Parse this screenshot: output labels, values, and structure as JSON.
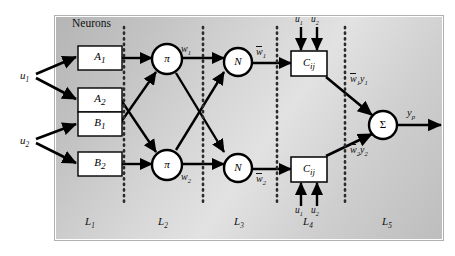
{
  "figure": {
    "title_label": "Neurons",
    "background": "#d0d0d0",
    "frame_color": "#ffffff"
  },
  "inputs": [
    {
      "name": "u1",
      "label": "u",
      "sub": "1"
    },
    {
      "name": "u2",
      "label": "u",
      "sub": "2"
    }
  ],
  "layer1_nodes": [
    {
      "name": "A1",
      "label": "A",
      "sub": "1"
    },
    {
      "name": "A2",
      "label": "A",
      "sub": "2"
    },
    {
      "name": "B1",
      "label": "B",
      "sub": "1"
    },
    {
      "name": "B2",
      "label": "B",
      "sub": "2"
    }
  ],
  "layer2_nodes": [
    {
      "name": "pi-top",
      "label": "π"
    },
    {
      "name": "pi-bottom",
      "label": "π"
    }
  ],
  "layer3_nodes": [
    {
      "name": "N-top",
      "label": "N"
    },
    {
      "name": "N-bottom",
      "label": "N"
    }
  ],
  "layer4_nodes": [
    {
      "name": "Cij-top",
      "label": "C",
      "sub": "ij"
    },
    {
      "name": "Cij-bottom",
      "label": "C",
      "sub": "ij"
    }
  ],
  "layer5_node": {
    "name": "sigma",
    "label": "Σ"
  },
  "edge_labels": {
    "w1": {
      "base": "w",
      "sub": "1"
    },
    "w2": {
      "base": "w",
      "sub": "2"
    },
    "wbar1": {
      "base": "w",
      "sub": "1",
      "overbar": true
    },
    "wbar2": {
      "base": "w",
      "sub": "2",
      "overbar": true
    },
    "wbar1y1": {
      "base": "w",
      "sub": "1",
      "second": "y",
      "second_sub": "1",
      "overbar": true
    },
    "wbar2y2": {
      "base": "w",
      "sub": "2",
      "second": "y",
      "second_sub": "2",
      "overbar": true
    },
    "output": {
      "base": "y",
      "sub": "p"
    }
  },
  "consequent_inputs_top": [
    {
      "label": "u",
      "sub": "1"
    },
    {
      "label": "u",
      "sub": "2"
    }
  ],
  "consequent_inputs_bottom": [
    {
      "label": "u",
      "sub": "1"
    },
    {
      "label": "u",
      "sub": "2"
    }
  ],
  "layer_labels": [
    {
      "name": "L1",
      "base": "L",
      "sub": "1"
    },
    {
      "name": "L2",
      "base": "L",
      "sub": "2"
    },
    {
      "name": "L3",
      "base": "L",
      "sub": "3"
    },
    {
      "name": "L4",
      "base": "L",
      "sub": "4"
    },
    {
      "name": "L5",
      "base": "L",
      "sub": "5"
    }
  ]
}
